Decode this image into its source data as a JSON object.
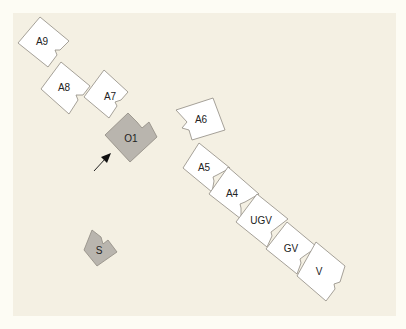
{
  "colors": {
    "page_background": "#fdfcf4",
    "panel_background": "#f4f0e3",
    "piece_white": "#ffffff",
    "piece_gray": "#b9b5ae",
    "outline": "#8f8a82",
    "arrow": "#111111"
  },
  "pieces": [
    {
      "id": "A9",
      "label": "A9",
      "fill": "white",
      "points": "40,17 69,41 60,50 55,50 57,55 48,67 18,43",
      "label_x": 42,
      "label_y": 42
    },
    {
      "id": "A8",
      "label": "A8",
      "fill": "white",
      "points": "61,62 90,86 83,95 76,95 78,100 69,114 41,89",
      "label_x": 64,
      "label_y": 88
    },
    {
      "id": "A7",
      "label": "A7",
      "fill": "white",
      "points": "104,70 128,92 121,100 115,102 117,106 109,118 84,97",
      "label_x": 110,
      "label_y": 97
    },
    {
      "id": "O1",
      "label": "O1",
      "fill": "gray",
      "points": "128,113 137,122 142,128 149,122 157,137 130,162 105,135",
      "label_x": 131,
      "label_y": 139
    },
    {
      "id": "A6",
      "label": "A6",
      "fill": "white",
      "points": "176,110 213,98 225,130 192,140 189,130 182,128 187,122",
      "label_x": 201,
      "label_y": 120
    },
    {
      "id": "A5",
      "label": "A5",
      "fill": "white",
      "points": "199,143 230,168 217,175 213,177 214,181 212,192 183,168",
      "label_x": 204,
      "label_y": 168
    },
    {
      "id": "A4",
      "label": "A4",
      "fill": "white",
      "points": "228,167 259,194 245,202 240,204 241,208 241,219 209,194",
      "label_x": 232,
      "label_y": 194
    },
    {
      "id": "UGV",
      "label": "UGV",
      "fill": "white",
      "points": "257,194 288,219 275,229 271,232 272,236 267,247 236,222",
      "label_x": 261,
      "label_y": 221
    },
    {
      "id": "GV",
      "label": "GV",
      "fill": "white",
      "points": "287,222 317,247 304,256 300,259 301,263 297,274 266,249",
      "label_x": 291,
      "label_y": 249
    },
    {
      "id": "V",
      "label": "V",
      "fill": "white",
      "points": "316,242 345,266 340,282 334,284 335,289 326,301 297,276",
      "label_x": 319,
      "label_y": 272
    },
    {
      "id": "S",
      "label": "S",
      "fill": "gray",
      "points": "92,230 101,237 103,244 108,240 117,252 97,266 84,250",
      "label_x": 99,
      "label_y": 251
    }
  ],
  "arrow": {
    "x1": 94,
    "y1": 171,
    "x2": 106,
    "y2": 158,
    "head": "111,153 101,157 107,163"
  }
}
